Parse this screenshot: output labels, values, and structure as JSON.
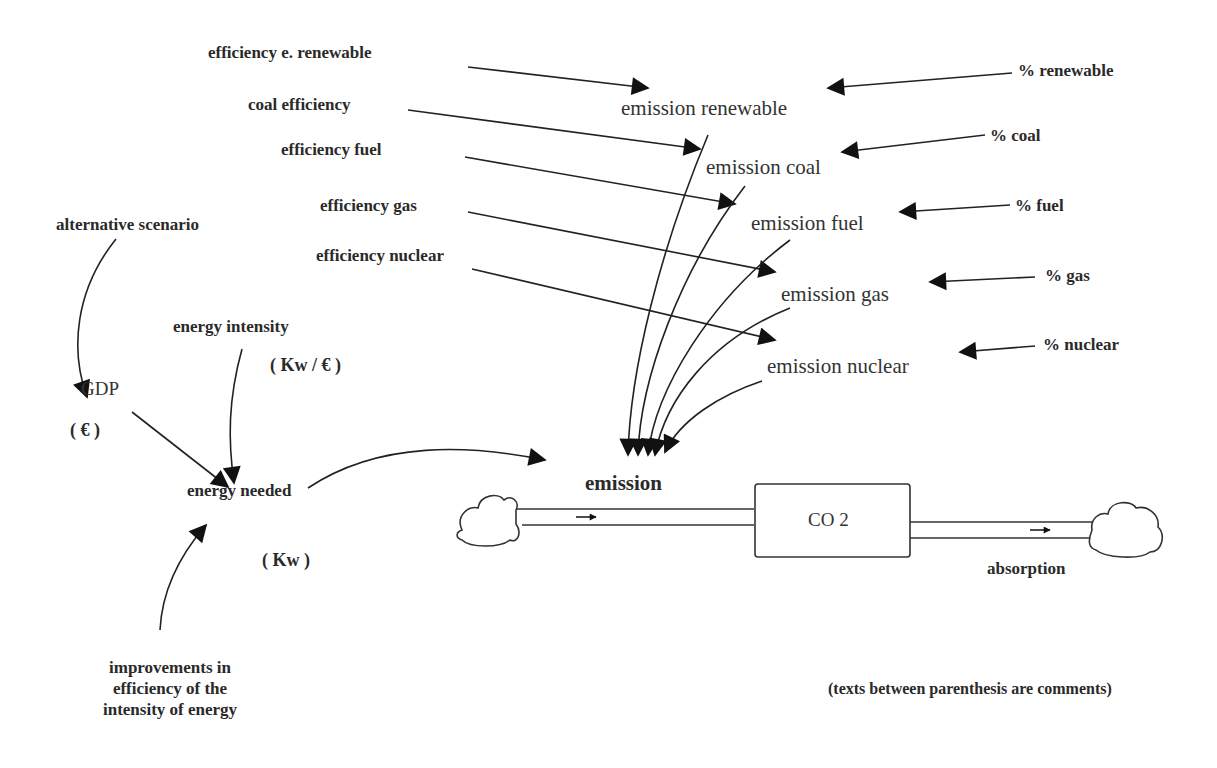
{
  "diagram": {
    "type": "stock-and-flow",
    "inputs": {
      "efficiency_renewable": "efficiency e. renewable",
      "coal_efficiency": "coal efficiency",
      "efficiency_fuel": "efficiency fuel",
      "efficiency_gas": "efficiency gas",
      "efficiency_nuclear": "efficiency nuclear",
      "pct_renewable": "% renewable",
      "pct_coal": "% coal",
      "pct_fuel": "% fuel",
      "pct_gas": "% gas",
      "pct_nuclear": "% nuclear",
      "alternative_scenario": "alternative scenario",
      "energy_intensity": "energy intensity",
      "energy_intensity_unit": "( Kw / € )",
      "improvements": [
        "improvements in",
        "efficiency of the",
        "intensity of energy"
      ]
    },
    "emissions": {
      "renewable": "emission renewable",
      "coal": "emission coal",
      "fuel": "emission fuel",
      "gas": "emission gas",
      "nuclear": "emission nuclear"
    },
    "gdp": "GDP",
    "gdp_unit": "( € )",
    "energy_needed": "energy needed",
    "energy_needed_unit": "( Kw )",
    "flow_in": "emission",
    "stock": "CO 2",
    "flow_out": "absorption",
    "note": "(texts between parenthesis are comments)"
  }
}
